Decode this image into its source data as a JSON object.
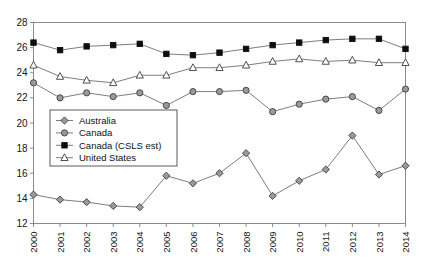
{
  "chart_data": {
    "type": "line",
    "title": "",
    "subtitle": "",
    "xlabel": "",
    "ylabel": "",
    "x": [
      2000,
      2001,
      2002,
      2003,
      2004,
      2005,
      2006,
      2007,
      2008,
      2009,
      2010,
      2011,
      2012,
      2013,
      2014
    ],
    "categories": [
      "2000",
      "2001",
      "2002",
      "2003",
      "2004",
      "2005",
      "2006",
      "2007",
      "2008",
      "2009",
      "2010",
      "2011",
      "2012",
      "2013",
      "2014"
    ],
    "ylim": [
      12,
      28
    ],
    "yticks": [
      12,
      14,
      16,
      18,
      20,
      22,
      24,
      26,
      28
    ],
    "ytick_labels": [
      "12",
      "14",
      "16",
      "18",
      "20",
      "22",
      "24",
      "26",
      "28"
    ],
    "xlim": [
      2000,
      2014
    ],
    "grid": false,
    "legend_position": "center-left",
    "series": [
      {
        "name": "Australia",
        "marker": "diamond",
        "marker_fill": "#9a9a9a",
        "marker_stroke": "#3d3d3d",
        "line_color": "#6e6e6e",
        "values": [
          14.3,
          13.9,
          13.7,
          13.4,
          13.3,
          15.8,
          15.2,
          16.0,
          17.6,
          14.2,
          15.4,
          16.3,
          19.0,
          15.9,
          16.6
        ]
      },
      {
        "name": "Canada",
        "marker": "circle",
        "marker_fill": "#9a9a9a",
        "marker_stroke": "#3d3d3d",
        "line_color": "#6e6e6e",
        "values": [
          23.2,
          22.0,
          22.4,
          22.1,
          22.4,
          21.4,
          22.5,
          22.5,
          22.6,
          20.9,
          21.5,
          21.9,
          22.1,
          21.0,
          22.7
        ]
      },
      {
        "name": "Canada (CSLS est)",
        "marker": "square",
        "marker_fill": "#0d0d0d",
        "marker_stroke": "#0d0d0d",
        "line_color": "#6e6e6e",
        "values": [
          26.4,
          25.8,
          26.1,
          26.2,
          26.3,
          25.5,
          25.4,
          25.6,
          25.9,
          26.2,
          26.4,
          26.6,
          26.7,
          26.7,
          25.9
        ]
      },
      {
        "name": "United States",
        "marker": "triangle",
        "marker_fill": "#ffffff",
        "marker_stroke": "#3d3d3d",
        "line_color": "#6e6e6e",
        "values": [
          24.6,
          23.7,
          23.4,
          23.2,
          23.8,
          23.8,
          24.4,
          24.4,
          24.6,
          24.9,
          25.1,
          24.9,
          25.0,
          24.8,
          24.8
        ]
      }
    ]
  },
  "legend": {
    "items": [
      {
        "label": "Australia"
      },
      {
        "label": "Canada"
      },
      {
        "label": "Canada (CSLS est)"
      },
      {
        "label": "United States"
      }
    ]
  },
  "colors": {
    "background": "#ffffff",
    "axis": "#8a8a8a",
    "line": "#6e6e6e",
    "marker_gray": "#9a9a9a",
    "marker_black": "#0d0d0d",
    "text": "#111111"
  }
}
